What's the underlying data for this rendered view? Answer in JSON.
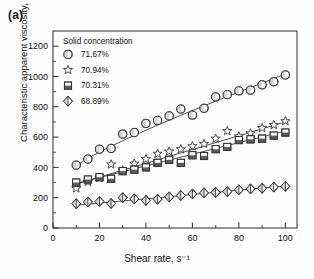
{
  "panel": {
    "label": "(a)"
  },
  "chart_data": {
    "type": "scatter",
    "title": "",
    "xlabel": "Shear rate, s⁻¹",
    "ylabel": "Characteristic apparent viscosity, mPa·s",
    "xlim": [
      0,
      105
    ],
    "ylim": [
      0,
      1300
    ],
    "xticks": [
      0,
      20,
      40,
      60,
      80,
      100
    ],
    "yticks": [
      0,
      200,
      400,
      600,
      800,
      1000,
      1200
    ],
    "xtick_labels": [
      "0",
      "20",
      "40",
      "60",
      "80",
      "100"
    ],
    "ytick_labels": [
      "0",
      "200",
      "400",
      "600",
      "800",
      "1000",
      "1200"
    ],
    "x_minor_step": 10,
    "y_minor_step": 100,
    "grid": false,
    "legend_position": "upper-left-inside",
    "legend_title": "Solid concentration",
    "x": [
      10,
      15,
      20,
      25,
      30,
      35,
      40,
      45,
      50,
      55,
      60,
      65,
      70,
      75,
      80,
      85,
      90,
      95,
      100
    ],
    "series": [
      {
        "name": "71.67%",
        "marker": "half-filled-circle",
        "values": [
          415,
          455,
          520,
          525,
          620,
          630,
          690,
          710,
          740,
          785,
          745,
          790,
          865,
          880,
          905,
          910,
          945,
          965,
          1010
        ],
        "fit": {
          "type": "curve",
          "y_start": 410,
          "y_end": 1015
        }
      },
      {
        "name": "70.94%",
        "marker": "open-star",
        "values": [
          262,
          305,
          330,
          420,
          380,
          425,
          455,
          490,
          505,
          520,
          540,
          555,
          590,
          640,
          605,
          625,
          660,
          680,
          705
        ],
        "fit": {
          "type": "line",
          "y_start": 290,
          "y_end": 700
        }
      },
      {
        "name": "70.31%",
        "marker": "half-filled-square",
        "values": [
          300,
          320,
          335,
          325,
          375,
          385,
          400,
          430,
          450,
          430,
          480,
          475,
          520,
          535,
          580,
          585,
          590,
          610,
          630
        ],
        "fit": {
          "type": "line",
          "y_start": 295,
          "y_end": 640
        }
      },
      {
        "name": "68.89%",
        "marker": "split-diamond",
        "values": [
          160,
          172,
          175,
          162,
          200,
          192,
          182,
          190,
          205,
          215,
          225,
          232,
          235,
          240,
          252,
          258,
          262,
          270,
          275
        ],
        "fit": {
          "type": "line",
          "y_start": 150,
          "y_end": 278
        }
      }
    ]
  }
}
